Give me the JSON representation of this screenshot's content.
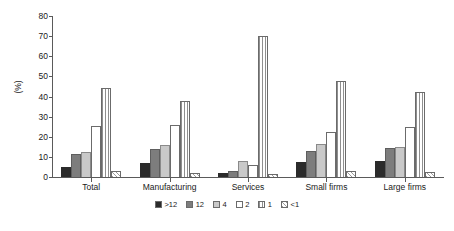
{
  "chart_data": {
    "type": "bar",
    "title": "",
    "subtitle": "",
    "xlabel": "",
    "ylabel": "(%)",
    "ylim": [
      0,
      80
    ],
    "ytick_step": 10,
    "yticks": [
      "0",
      "10",
      "20",
      "30",
      "40",
      "50",
      "60",
      "70",
      "80"
    ],
    "grid": false,
    "legend_position": "bottom-center",
    "categories": [
      "Total",
      "Manufacturing",
      "Services",
      "Small firms",
      "Large firms"
    ],
    "series": [
      {
        "name": ">12",
        "color": "#2b2b2b",
        "pattern": "solid-dark",
        "values": [
          5,
          7,
          2,
          7.5,
          8
        ]
      },
      {
        "name": "12",
        "color": "#7d7d7d",
        "pattern": "solid-mid",
        "values": [
          11.5,
          14,
          3,
          13,
          14.5
        ]
      },
      {
        "name": "4",
        "color": "#c9c9c9",
        "pattern": "solid-light",
        "values": [
          12.5,
          16,
          8,
          16.5,
          15
        ]
      },
      {
        "name": "2",
        "color": "#ffffff",
        "pattern": "outline",
        "values": [
          25.5,
          26,
          6,
          22.5,
          25
        ]
      },
      {
        "name": "1",
        "color": "#ffffff",
        "pattern": "vertical-hatch",
        "values": [
          44,
          38,
          70,
          47.5,
          42
        ]
      },
      {
        "name": "<1",
        "color": "#ffffff",
        "pattern": "diagonal-hatch",
        "values": [
          3,
          2,
          1.5,
          3,
          2.5
        ]
      }
    ]
  },
  "legend": {
    "items": [
      {
        "label": ">12"
      },
      {
        "label": "12"
      },
      {
        "label": "4"
      },
      {
        "label": "2"
      },
      {
        "label": "1"
      },
      {
        "label": "<1"
      }
    ]
  }
}
